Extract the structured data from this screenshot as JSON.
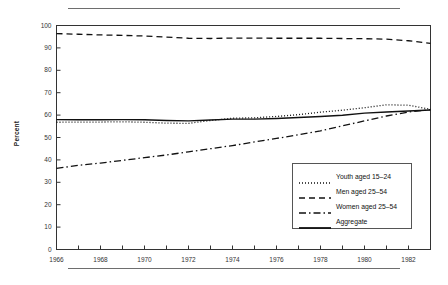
{
  "figure": {
    "clipped_header_text": "",
    "ylabel": "Percent",
    "y_ticks": [
      0,
      10,
      20,
      30,
      40,
      50,
      60,
      70,
      80,
      90,
      100
    ],
    "x_ticks_labeled": [
      1966,
      1968,
      1970,
      1972,
      1974,
      1976,
      1978,
      1980,
      1982
    ],
    "x_minor_years": [
      1967,
      1969,
      1971,
      1973,
      1975,
      1977,
      1979,
      1981,
      1983
    ]
  },
  "legend": {
    "items": [
      {
        "label": "Youth aged 15–24",
        "style": "dotted"
      },
      {
        "label": "Men aged 25–54",
        "style": "dashed"
      },
      {
        "label": "Women aged 25–54",
        "style": "dash-dot"
      },
      {
        "label": "Aggregate",
        "style": "solid"
      }
    ]
  },
  "chart_data": {
    "type": "line",
    "title": "",
    "xlabel": "",
    "ylabel": "Percent",
    "xlim": [
      1966,
      1983
    ],
    "ylim": [
      0,
      100
    ],
    "grid": false,
    "legend_position": "inside-lower-right",
    "x": [
      1966,
      1967,
      1968,
      1969,
      1970,
      1971,
      1972,
      1973,
      1974,
      1975,
      1976,
      1977,
      1978,
      1979,
      1980,
      1981,
      1982,
      1983
    ],
    "series": [
      {
        "name": "Youth aged 15–24",
        "style": "dotted",
        "values": [
          56.8,
          56.9,
          56.9,
          57.0,
          56.8,
          56.4,
          56.3,
          57.6,
          58.6,
          58.8,
          59.4,
          60.2,
          61.3,
          62.2,
          63.3,
          64.6,
          64.4,
          62.6
        ]
      },
      {
        "name": "Men aged 25–54",
        "style": "dashed",
        "values": [
          96.4,
          96.1,
          95.8,
          95.6,
          95.3,
          94.8,
          94.3,
          94.2,
          94.4,
          94.4,
          94.3,
          94.3,
          94.3,
          94.2,
          94.1,
          93.9,
          93.2,
          92.0
        ]
      },
      {
        "name": "Women aged 25–54",
        "style": "dash-dot",
        "values": [
          36.2,
          37.6,
          38.6,
          39.8,
          41.0,
          42.2,
          43.6,
          45.0,
          46.4,
          48.0,
          49.6,
          51.2,
          53.0,
          55.2,
          57.4,
          59.6,
          61.4,
          62.4
        ]
      },
      {
        "name": "Aggregate",
        "style": "solid",
        "values": [
          58.0,
          57.9,
          57.9,
          58.0,
          57.9,
          57.6,
          57.4,
          57.8,
          58.2,
          58.2,
          58.5,
          58.9,
          59.4,
          59.9,
          60.9,
          61.4,
          61.8,
          62.3
        ]
      }
    ]
  }
}
